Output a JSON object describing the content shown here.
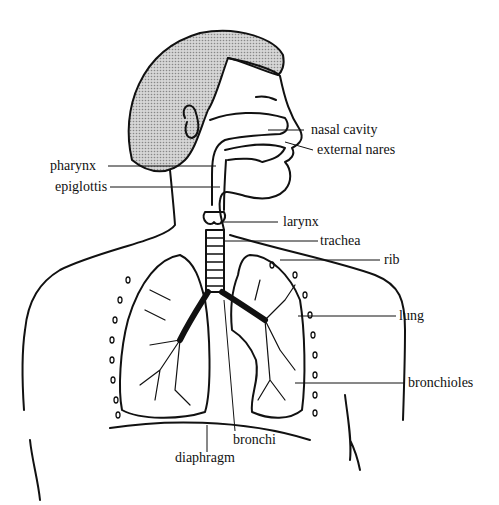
{
  "diagram": {
    "labels": {
      "nasal_cavity": "nasal cavity",
      "external_nares": "external nares",
      "pharynx": "pharynx",
      "epiglottis": "epiglottis",
      "larynx": "larynx",
      "trachea": "trachea",
      "rib": "rib",
      "lung": "lung",
      "bronchioles": "bronchioles",
      "bronchi": "bronchi",
      "diaphragm": "diaphragm"
    },
    "colors": {
      "line": "#111111",
      "hair": "#b8b8b8",
      "background": "#ffffff"
    }
  }
}
